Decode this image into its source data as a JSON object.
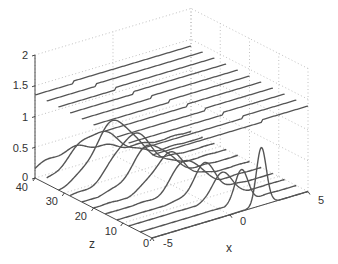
{
  "chart_data": {
    "type": "line",
    "subtype": "3d-waterfall",
    "title": "",
    "xlabel": "x",
    "ylabel": "z",
    "zlabel": "",
    "xlim": [
      -5,
      5
    ],
    "ylim_z": [
      0,
      40
    ],
    "vlim": [
      0,
      2
    ],
    "x_ticks": [
      "-5",
      "0",
      "5"
    ],
    "z_ticks": [
      "0",
      "10",
      "20",
      "30",
      "40"
    ],
    "v_ticks": [
      "0",
      "0.5",
      "1",
      "1.5",
      "2"
    ],
    "grid": true,
    "line_color": "#555555",
    "grid_color": "#b0b0b0",
    "z_slices": [
      0,
      4,
      8,
      12,
      16,
      20,
      24,
      28,
      32,
      36,
      40
    ],
    "series": [
      {
        "name": "lower packets",
        "description": "Gaussian pulse at each z slice; narrow tall peak at z=0 near x=2, broadening and shifting toward negative x as z increases",
        "peaks": [
          {
            "z": 0,
            "center": 2.0,
            "width": 0.45,
            "height": 0.95
          },
          {
            "z": 4,
            "center": 1.5,
            "width": 0.6,
            "height": 0.5
          },
          {
            "z": 8,
            "center": 1.0,
            "width": 0.8,
            "height": 0.45
          },
          {
            "z": 12,
            "center": 0.6,
            "width": 1.0,
            "height": 0.48
          },
          {
            "z": 16,
            "center": 0.2,
            "width": 1.2,
            "height": 0.5
          },
          {
            "z": 20,
            "center": -0.2,
            "width": 1.4,
            "height": 0.52
          },
          {
            "z": 24,
            "center": -0.6,
            "width": 1.6,
            "height": 0.6
          },
          {
            "z": 28,
            "center": -1.0,
            "width": 1.7,
            "height": 0.7
          },
          {
            "z": 32,
            "center": -1.4,
            "width": 1.8,
            "height": 0.85
          },
          {
            "z": 36,
            "center": -1.9,
            "width": 2.2,
            "height": 0.6
          },
          {
            "z": 40,
            "center": -2.6,
            "width": 3.0,
            "height": 0.3
          }
        ]
      },
      {
        "name": "upper offset lines",
        "description": "Nearly flat lines offset by ~1.35 with a small step near the packet location",
        "offset": 1.35,
        "step_height": 0.04
      }
    ]
  }
}
